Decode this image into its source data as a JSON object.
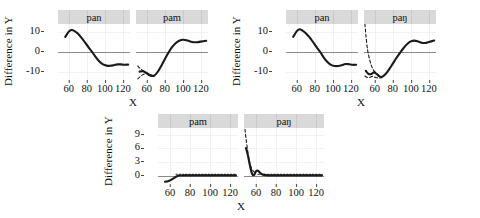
{
  "figure": {
    "axis_label_x": "X",
    "axis_label_y": "Difference in Y"
  },
  "chart_data": {
    "type": "line",
    "title": "",
    "xlabel": "X",
    "ylabel": "Difference in Y",
    "xlim": [
      48,
      128
    ],
    "xticks": [
      60,
      80,
      100,
      120
    ],
    "grid": true,
    "legend": "none",
    "note": "Six smoothing-spline difference curves in three panel groups; solid line = estimated difference, dashed/dotted lines = pointwise confidence band; gray horizontal line marks zero.",
    "groups": [
      {
        "name": "group-top-left",
        "ylim": [
          -15,
          14
        ],
        "yticks": [
          10,
          0,
          -10
        ],
        "panels": [
          {
            "label": "pan",
            "series": [
              {
                "name": "difference",
                "style": "solid",
                "x": [
                  56,
                  60,
                  63,
                  66,
                  70,
                  74,
                  78,
                  82,
                  86,
                  90,
                  94,
                  98,
                  102,
                  106,
                  110,
                  114,
                  118,
                  122,
                  126
                ],
                "y": [
                  7.5,
                  10.2,
                  11.0,
                  10.6,
                  9.2,
                  7.2,
                  4.8,
                  2.3,
                  0.0,
                  -2.6,
                  -4.8,
                  -6.2,
                  -6.8,
                  -6.9,
                  -6.6,
                  -6.2,
                  -6.2,
                  -6.4,
                  -6.3
                ]
              }
            ]
          },
          {
            "label": "pam",
            "series": [
              {
                "name": "difference",
                "style": "solid",
                "x": [
                  52,
                  56,
                  60,
                  64,
                  68,
                  72,
                  76,
                  80,
                  84,
                  88,
                  92,
                  96,
                  100,
                  104,
                  108,
                  112,
                  116,
                  120,
                  126
                ],
                "y": [
                  -9.8,
                  -9.6,
                  -10.6,
                  -11.8,
                  -11.9,
                  -10.0,
                  -7.0,
                  -3.6,
                  -0.4,
                  2.4,
                  4.4,
                  5.6,
                  6.1,
                  5.9,
                  5.3,
                  4.9,
                  4.9,
                  5.2,
                  5.6
                ]
              },
              {
                "name": "confidence-upper",
                "style": "dashed",
                "x": [
                  50,
                  53,
                  56,
                  60,
                  64,
                  68
                ],
                "y": [
                  -7.0,
                  -8.4,
                  -9.4,
                  -10.4,
                  -11.4,
                  -11.8
                ]
              },
              {
                "name": "confidence-lower",
                "style": "dashed",
                "x": [
                  50,
                  53,
                  56,
                  60,
                  64,
                  68
                ],
                "y": [
                  -13.4,
                  -12.2,
                  -11.2,
                  -11.0,
                  -12.2,
                  -12.1
                ]
              }
            ]
          }
        ]
      },
      {
        "name": "group-top-right",
        "ylim": [
          -15,
          14
        ],
        "yticks": [
          10,
          0,
          -10
        ],
        "panels": [
          {
            "label": "pan",
            "series": [
              {
                "name": "difference",
                "style": "solid",
                "x": [
                  56,
                  60,
                  63,
                  66,
                  70,
                  74,
                  78,
                  82,
                  86,
                  90,
                  94,
                  98,
                  102,
                  106,
                  110,
                  114,
                  118,
                  122,
                  126
                ],
                "y": [
                  7.6,
                  10.4,
                  11.4,
                  10.8,
                  9.4,
                  7.4,
                  5.0,
                  2.4,
                  0.0,
                  -2.8,
                  -5.0,
                  -6.4,
                  -7.0,
                  -7.0,
                  -6.6,
                  -6.0,
                  -6.1,
                  -6.4,
                  -6.4
                ]
              }
            ]
          },
          {
            "label": "paŋ",
            "series": [
              {
                "name": "difference",
                "style": "solid",
                "x": [
                  50,
                  53,
                  56,
                  59,
                  62,
                  65,
                  68,
                  72,
                  76,
                  80,
                  84,
                  88,
                  92,
                  96,
                  100,
                  104,
                  108,
                  112,
                  116,
                  120,
                  126
                ],
                "y": [
                  -9.4,
                  -11.0,
                  -11.0,
                  -10.2,
                  -11.0,
                  -12.2,
                  -12.4,
                  -11.0,
                  -8.6,
                  -5.8,
                  -3.0,
                  -0.4,
                  2.0,
                  4.0,
                  5.3,
                  5.7,
                  5.3,
                  4.6,
                  4.5,
                  5.0,
                  5.7
                ]
              },
              {
                "name": "confidence-upper",
                "style": "dashed",
                "x": [
                  49,
                  50,
                  52,
                  55,
                  58,
                  62,
                  66
                ],
                "y": [
                  14.0,
                  9.0,
                  1.0,
                  -5.0,
                  -8.6,
                  -10.8,
                  -12.2
                ]
              },
              {
                "name": "confidence-lower",
                "style": "dashed",
                "x": [
                  49,
                  51,
                  54,
                  57,
                  60,
                  64,
                  68
                ],
                "y": [
                  -12.0,
                  -12.6,
                  -12.8,
                  -12.2,
                  -12.6,
                  -13.0,
                  -12.8
                ]
              }
            ]
          }
        ]
      },
      {
        "name": "group-bottom",
        "ylim": [
          -1.8,
          10.5
        ],
        "yticks": [
          9,
          6,
          3,
          0
        ],
        "panels": [
          {
            "label": "pam",
            "series": [
              {
                "name": "difference",
                "style": "solid",
                "x": [
                  55,
                  58,
                  61,
                  64,
                  67,
                  70,
                  74,
                  78,
                  82,
                  86,
                  90,
                  94,
                  98,
                  102,
                  106,
                  110,
                  114,
                  118,
                  122,
                  126
                ],
                "y": [
                  -1.3,
                  -1.2,
                  -0.9,
                  -0.5,
                  -0.1,
                  0.05,
                  0.1,
                  0.1,
                  0.1,
                  0.1,
                  0.1,
                  0.1,
                  0.1,
                  0.1,
                  0.1,
                  0.1,
                  0.1,
                  0.1,
                  0.1,
                  0.1
                ]
              },
              {
                "name": "confidence-band",
                "style": "dotted",
                "x": [
                  66,
                  70,
                  74,
                  78,
                  82,
                  86,
                  90,
                  94,
                  98,
                  102,
                  106,
                  110,
                  114,
                  118,
                  122,
                  126
                ],
                "y": [
                  0.35,
                  0.35,
                  0.35,
                  0.35,
                  0.35,
                  0.35,
                  0.35,
                  0.35,
                  0.35,
                  0.35,
                  0.35,
                  0.35,
                  0.35,
                  0.35,
                  0.35,
                  0.35
                ]
              }
            ]
          },
          {
            "label": "paŋ",
            "series": [
              {
                "name": "difference",
                "style": "solid",
                "x": [
                  50,
                  52,
                  54,
                  56,
                  58,
                  60,
                  62,
                  65,
                  68,
                  72,
                  76,
                  80,
                  84,
                  88,
                  92,
                  96,
                  100,
                  104,
                  108,
                  112,
                  116,
                  120,
                  126
                ],
                "y": [
                  6.1,
                  4.4,
                  2.2,
                  0.5,
                  0.15,
                  1.0,
                  1.1,
                  0.5,
                  0.2,
                  0.1,
                  0.1,
                  0.1,
                  0.1,
                  0.1,
                  0.1,
                  0.1,
                  0.1,
                  0.1,
                  0.1,
                  0.1,
                  0.1,
                  0.1,
                  0.1
                ]
              },
              {
                "name": "confidence-upper",
                "style": "dashed",
                "x": [
                  49,
                  50,
                  52,
                  54,
                  57,
                  60
                ],
                "y": [
                  10.2,
                  8.2,
                  5.0,
                  2.6,
                  1.1,
                  0.6
                ]
              },
              {
                "name": "confidence-band",
                "style": "dotted",
                "x": [
                  62,
                  66,
                  70,
                  74,
                  78,
                  82,
                  86,
                  90,
                  94,
                  98,
                  102,
                  106,
                  110,
                  114,
                  118,
                  122,
                  126
                ],
                "y": [
                  0.35,
                  0.35,
                  0.35,
                  0.35,
                  0.35,
                  0.35,
                  0.35,
                  0.35,
                  0.35,
                  0.35,
                  0.35,
                  0.35,
                  0.35,
                  0.35,
                  0.35,
                  0.35,
                  0.35
                ]
              }
            ]
          }
        ]
      }
    ]
  }
}
